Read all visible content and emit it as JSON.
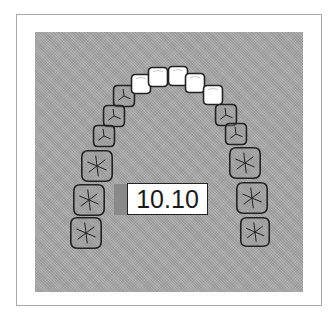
{
  "figure": {
    "type": "maxillary dental arch diagram",
    "label": "10.10",
    "colors": {
      "background_field": "#a9a9a9",
      "frame_border": "#a8a8a8",
      "anterior_teeth_fill": "#ffffff",
      "posterior_teeth_fill": "#9a9a9a",
      "outline": "#222222"
    },
    "teeth": {
      "anterior_highlighted": [
        {
          "id": "right-lateral-incisor",
          "cx": 141,
          "cy": 84
        },
        {
          "id": "right-central-incisor",
          "cx": 158,
          "cy": 77
        },
        {
          "id": "left-central-incisor",
          "cx": 178,
          "cy": 76
        },
        {
          "id": "left-lateral-incisor",
          "cx": 195,
          "cy": 83
        },
        {
          "id": "left-canine",
          "cx": 213,
          "cy": 95
        }
      ],
      "right_posterior": [
        {
          "id": "right-canine",
          "cx": 124,
          "cy": 96,
          "r": 11
        },
        {
          "id": "right-first-premolar",
          "cx": 114,
          "cy": 116,
          "r": 11
        },
        {
          "id": "right-second-premolar",
          "cx": 104,
          "cy": 136,
          "r": 11
        },
        {
          "id": "right-first-molar",
          "cx": 97,
          "cy": 166,
          "r": 16
        },
        {
          "id": "right-second-molar",
          "cx": 89,
          "cy": 200,
          "r": 16
        },
        {
          "id": "right-third-molar",
          "cx": 86,
          "cy": 233,
          "r": 16
        }
      ],
      "left_posterior": [
        {
          "id": "left-first-premolar",
          "cx": 226,
          "cy": 115,
          "r": 11
        },
        {
          "id": "left-second-premolar",
          "cx": 236,
          "cy": 134,
          "r": 11
        },
        {
          "id": "left-first-molar",
          "cx": 245,
          "cy": 163,
          "r": 16
        },
        {
          "id": "left-second-molar",
          "cx": 252,
          "cy": 198,
          "r": 16
        },
        {
          "id": "left-third-molar",
          "cx": 255,
          "cy": 232,
          "r": 15
        }
      ]
    }
  }
}
